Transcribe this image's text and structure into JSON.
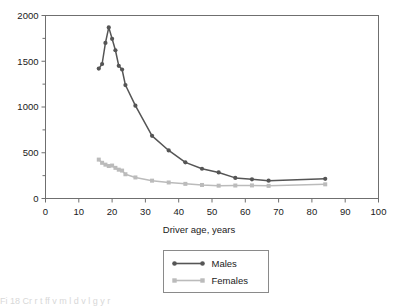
{
  "figure": {
    "background": "#ffffff",
    "frame_color": "#6f6f6f",
    "bottom_artifact_text": "Fi        18   Cr        r t     ff   v   m l   d   v   l g   y   r"
  },
  "chart_data": {
    "type": "line",
    "title": "",
    "xlabel": "Driver age, years",
    "ylabel": "",
    "xlim": [
      0,
      100
    ],
    "ylim": [
      0,
      2000
    ],
    "xticks": [
      0,
      10,
      20,
      30,
      40,
      50,
      60,
      70,
      80,
      90,
      100
    ],
    "xtick_labels": [
      "0",
      "10",
      "20",
      "30",
      "40",
      "50",
      "60",
      "70",
      "80",
      "90",
      "100"
    ],
    "yticks": [
      0,
      500,
      1000,
      1500,
      2000
    ],
    "ytick_labels": [
      "0",
      "500",
      "1000",
      "1500",
      "2000"
    ],
    "y_minor_ticks": [
      250,
      750,
      1250,
      1750
    ],
    "grid": false,
    "legend_position": "below-center",
    "series": [
      {
        "name": "Males",
        "color": "#555555",
        "marker": "circle",
        "x": [
          16,
          17,
          18,
          19,
          20,
          21,
          22,
          23,
          24,
          27,
          32,
          37,
          42,
          47,
          52,
          57,
          62,
          67,
          84
        ],
        "y": [
          1420,
          1470,
          1700,
          1870,
          1745,
          1620,
          1450,
          1410,
          1240,
          1015,
          685,
          525,
          395,
          325,
          285,
          225,
          210,
          195,
          215
        ]
      },
      {
        "name": "Females",
        "color": "#bbbbbb",
        "marker": "square",
        "x": [
          16,
          17,
          18,
          19,
          20,
          21,
          22,
          23,
          24,
          27,
          32,
          37,
          42,
          47,
          52,
          57,
          62,
          67,
          84
        ],
        "y": [
          425,
          390,
          370,
          355,
          360,
          335,
          315,
          305,
          265,
          230,
          195,
          175,
          160,
          148,
          140,
          142,
          143,
          138,
          155
        ]
      }
    ],
    "legend_entries": [
      {
        "label": "Males",
        "color": "#555555",
        "marker": "circle"
      },
      {
        "label": "Females",
        "color": "#bbbbbb",
        "marker": "square"
      }
    ]
  }
}
